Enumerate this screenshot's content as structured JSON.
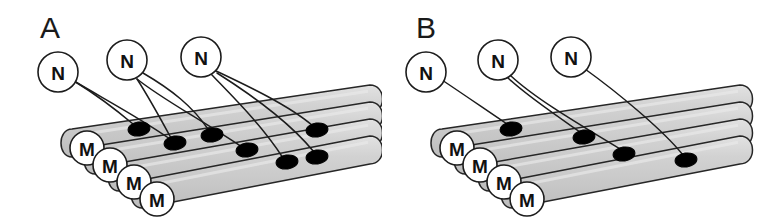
{
  "figure": {
    "background_color": "#ffffff",
    "line_color": "#1c1c1c",
    "tube_fill_color": "#cfcfcf",
    "tube_fill_color_light": "#dcdcdc",
    "synapse_color": "#000000",
    "node_fill_color": "#ffffff"
  },
  "panels": [
    {
      "id": "a",
      "letter": "A",
      "letter_x": 40,
      "letter_y": 38,
      "neuron_label": "N",
      "fiber_label": "M",
      "neurons": [
        {
          "label": "N",
          "cx": 58,
          "cy": 72,
          "r": 20
        },
        {
          "label": "N",
          "cx": 127,
          "cy": 60,
          "r": 20
        },
        {
          "label": "N",
          "cx": 201,
          "cy": 57,
          "r": 20
        }
      ],
      "fibers": [
        {
          "label": "M",
          "cx": 87,
          "cy": 148,
          "r": 17
        },
        {
          "label": "M",
          "cx": 110,
          "cy": 165,
          "r": 17
        },
        {
          "label": "M",
          "cx": 134,
          "cy": 182,
          "r": 17
        },
        {
          "label": "M",
          "cx": 157,
          "cy": 199,
          "r": 17
        }
      ],
      "synapses": [
        {
          "cx": 139,
          "cy": 129,
          "rx": 11,
          "ry": 7
        },
        {
          "cx": 175,
          "cy": 143,
          "rx": 11,
          "ry": 7
        },
        {
          "cx": 212,
          "cy": 135,
          "rx": 11,
          "ry": 7
        },
        {
          "cx": 247,
          "cy": 150,
          "rx": 11,
          "ry": 7
        },
        {
          "cx": 287,
          "cy": 162,
          "rx": 11,
          "ry": 7
        },
        {
          "cx": 317,
          "cy": 157,
          "rx": 11,
          "ry": 7
        },
        {
          "cx": 317,
          "cy": 130,
          "rx": 11,
          "ry": 7
        }
      ],
      "axons": [
        "M 74 81 C 100 97 114 108 133 124",
        "M 74 81 C 106 100 140 118 170 139",
        "M 137 79 C 148 96 158 114 171 138",
        "M 137 79 C 162 99 195 116 242 147",
        "M 143 73 C 172 90 192 106 208 129",
        "M 211 74 C 231 95 262 125 283 158",
        "M 214 70 C 248 86 290 106 313 126",
        "M 217 73 C 255 97 292 125 314 152"
      ],
      "tubes": [
        {
          "x1": 72,
          "y1": 143,
          "x2": 372,
          "y2": 99
        },
        {
          "x1": 95,
          "y1": 160,
          "x2": 372,
          "y2": 116
        },
        {
          "x1": 119,
          "y1": 177,
          "x2": 372,
          "y2": 133
        },
        {
          "x1": 142,
          "y1": 194,
          "x2": 372,
          "y2": 150
        }
      ],
      "tube_half_height": 14
    },
    {
      "id": "b",
      "letter": "B",
      "letter_x": 35,
      "letter_y": 38,
      "neuron_label": "N",
      "fiber_label": "M",
      "neurons": [
        {
          "label": "N",
          "cx": 45,
          "cy": 72,
          "r": 20
        },
        {
          "label": "N",
          "cx": 117,
          "cy": 60,
          "r": 20
        },
        {
          "label": "N",
          "cx": 190,
          "cy": 57,
          "r": 20
        }
      ],
      "fibers": [
        {
          "label": "M",
          "cx": 76,
          "cy": 148,
          "r": 17
        },
        {
          "label": "M",
          "cx": 99,
          "cy": 165,
          "r": 17
        },
        {
          "label": "M",
          "cx": 123,
          "cy": 182,
          "r": 17
        },
        {
          "label": "M",
          "cx": 146,
          "cy": 199,
          "r": 17
        }
      ],
      "synapses": [
        {
          "cx": 130,
          "cy": 129,
          "rx": 11,
          "ry": 7
        },
        {
          "cx": 203,
          "cy": 137,
          "rx": 11,
          "ry": 7
        },
        {
          "cx": 243,
          "cy": 154,
          "rx": 11,
          "ry": 7
        },
        {
          "cx": 305,
          "cy": 160,
          "rx": 11,
          "ry": 7
        }
      ],
      "axons": [
        "M 61 80 C 88 98 108 112 126 124",
        "M 127 78 C 146 96 176 116 199 132",
        "M 130 76 C 157 101 208 130 239 149",
        "M 204 69 C 236 92 282 130 302 155"
      ],
      "tubes": [
        {
          "x1": 61,
          "y1": 143,
          "x2": 361,
          "y2": 99
        },
        {
          "x1": 84,
          "y1": 160,
          "x2": 361,
          "y2": 116
        },
        {
          "x1": 108,
          "y1": 177,
          "x2": 361,
          "y2": 133
        },
        {
          "x1": 131,
          "y1": 194,
          "x2": 361,
          "y2": 150
        }
      ],
      "tube_half_height": 14
    }
  ]
}
